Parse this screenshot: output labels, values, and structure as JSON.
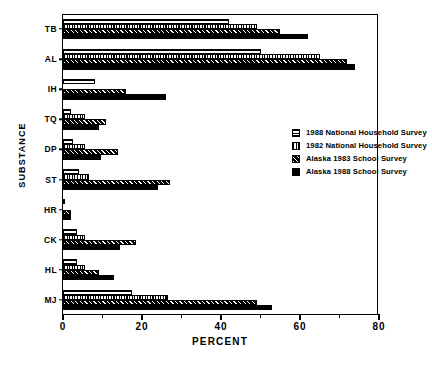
{
  "chart_data": {
    "type": "bar",
    "orientation": "horizontal",
    "title": "",
    "xlabel": "PERCENT",
    "ylabel": "SUBSTANCE",
    "xlim": [
      0,
      80
    ],
    "xticks": [
      "0",
      "20",
      "40",
      "60",
      "80"
    ],
    "grid": false,
    "legend_position": "inside-right",
    "categories": [
      "TB",
      "AL",
      "IH",
      "TQ",
      "DP",
      "ST",
      "HR",
      "CK",
      "HL",
      "MJ"
    ],
    "series": [
      {
        "name": "1988 National Household Survey",
        "pattern": "horizontal-lines",
        "values": [
          42,
          50,
          8,
          2,
          2.5,
          4,
          0.5,
          3.5,
          3.5,
          17.5
        ]
      },
      {
        "name": "1982 National Household Survey",
        "pattern": "vertical-lines",
        "values": [
          49,
          65,
          0,
          5.5,
          5.5,
          6.5,
          0,
          5.5,
          5.5,
          26.5
        ]
      },
      {
        "name": "Alaska 1983 School Survey",
        "pattern": "hatched",
        "values": [
          55,
          72,
          16,
          11,
          14,
          27,
          2,
          18.5,
          9,
          49
        ]
      },
      {
        "name": "Alaska 1988 School Survey",
        "pattern": "solid",
        "values": [
          62,
          74,
          26,
          9,
          9.5,
          24,
          2,
          14.5,
          13,
          53
        ]
      }
    ]
  },
  "legend": {
    "items": [
      {
        "label": "1988 National Household Survey",
        "pattern": "horizontal-lines"
      },
      {
        "label": "1982 National Household Survey",
        "pattern": "vertical-lines"
      },
      {
        "label": "Alaska 1983 School Survey",
        "pattern": "hatched"
      },
      {
        "label": "Alaska 1988 School Survey",
        "pattern": "solid"
      }
    ]
  },
  "axes": {
    "x_label": "PERCENT",
    "y_label": "SUBSTANCE",
    "x_ticks": [
      "0",
      "20",
      "40",
      "60",
      "80"
    ],
    "y_ticks": [
      "TB",
      "AL",
      "IH",
      "TQ",
      "DP",
      "ST",
      "HR",
      "CK",
      "HL",
      "MJ"
    ]
  },
  "title_strip": ""
}
